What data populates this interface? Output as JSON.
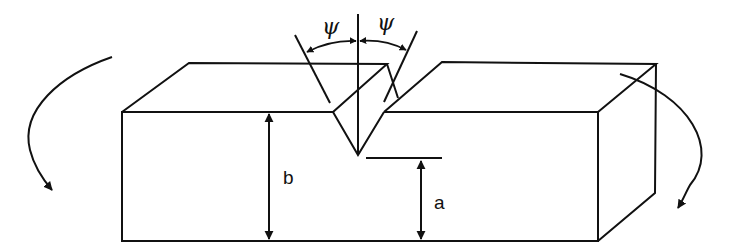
{
  "diagram": {
    "labels": {
      "psi_left": "ψ",
      "psi_right": "ψ",
      "depth_total": "b",
      "ligament": "a"
    },
    "colors": {
      "stroke": "#111111",
      "background": "#ffffff"
    }
  }
}
